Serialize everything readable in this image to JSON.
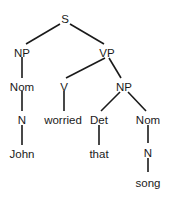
{
  "diagram": {
    "type": "parse-tree",
    "nodes": [
      {
        "id": "s",
        "label": "S",
        "x": 65,
        "y": 19
      },
      {
        "id": "np1",
        "label": "NP",
        "x": 22,
        "y": 53
      },
      {
        "id": "vp",
        "label": "VP",
        "x": 107,
        "y": 53
      },
      {
        "id": "nom1",
        "label": "Nom",
        "x": 22,
        "y": 87
      },
      {
        "id": "v",
        "label": "V",
        "x": 64,
        "y": 87
      },
      {
        "id": "np2",
        "label": "NP",
        "x": 124,
        "y": 87
      },
      {
        "id": "n1",
        "label": "N",
        "x": 22,
        "y": 120
      },
      {
        "id": "worried",
        "label": "worried",
        "x": 63,
        "y": 120
      },
      {
        "id": "det",
        "label": "Det",
        "x": 99,
        "y": 120
      },
      {
        "id": "nom2",
        "label": "Nom",
        "x": 148,
        "y": 120
      },
      {
        "id": "john",
        "label": "John",
        "x": 22,
        "y": 154
      },
      {
        "id": "that",
        "label": "that",
        "x": 99,
        "y": 154
      },
      {
        "id": "n2",
        "label": "N",
        "x": 148,
        "y": 153
      },
      {
        "id": "song",
        "label": "song",
        "x": 148,
        "y": 183
      }
    ],
    "edges": [
      {
        "from": "s",
        "to": "np1",
        "x1": 60,
        "y1": 24,
        "x2": 26,
        "y2": 44
      },
      {
        "from": "s",
        "to": "vp",
        "x1": 70,
        "y1": 24,
        "x2": 104,
        "y2": 44
      },
      {
        "from": "np1",
        "to": "nom1",
        "x1": 22,
        "y1": 57,
        "x2": 22,
        "y2": 78
      },
      {
        "from": "vp",
        "to": "v",
        "x1": 105,
        "y1": 58,
        "x2": 66,
        "y2": 78
      },
      {
        "from": "vp",
        "to": "np2",
        "x1": 109,
        "y1": 58,
        "x2": 121,
        "y2": 78
      },
      {
        "from": "nom1",
        "to": "n1",
        "x1": 22,
        "y1": 91,
        "x2": 22,
        "y2": 111
      },
      {
        "from": "v",
        "to": "worried",
        "x1": 64,
        "y1": 91,
        "x2": 64,
        "y2": 111
      },
      {
        "from": "np2",
        "to": "det",
        "x1": 120,
        "y1": 92,
        "x2": 101,
        "y2": 111
      },
      {
        "from": "np2",
        "to": "nom2",
        "x1": 128,
        "y1": 92,
        "x2": 146,
        "y2": 111
      },
      {
        "from": "n1",
        "to": "john",
        "x1": 22,
        "y1": 125,
        "x2": 22,
        "y2": 145
      },
      {
        "from": "det",
        "to": "that",
        "x1": 99,
        "y1": 125,
        "x2": 99,
        "y2": 145
      },
      {
        "from": "nom2",
        "to": "n2",
        "x1": 148,
        "y1": 125,
        "x2": 148,
        "y2": 143
      },
      {
        "from": "n2",
        "to": "song",
        "x1": 148,
        "y1": 158,
        "x2": 148,
        "y2": 172
      }
    ]
  }
}
